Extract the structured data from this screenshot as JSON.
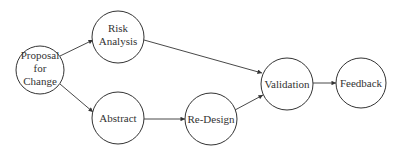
{
  "diagram": {
    "type": "flowchart",
    "nodes": [
      {
        "id": "proposal",
        "lines": [
          "Proposal",
          "for",
          "Change"
        ],
        "cx": 40,
        "cy": 70,
        "r": 24
      },
      {
        "id": "risk",
        "lines": [
          "Risk",
          "Analysis"
        ],
        "cx": 118,
        "cy": 37,
        "r": 26
      },
      {
        "id": "abstract",
        "lines": [
          "Abstract"
        ],
        "cx": 118,
        "cy": 118,
        "r": 26
      },
      {
        "id": "redesign",
        "lines": [
          "Re-Design"
        ],
        "cx": 211,
        "cy": 119,
        "r": 26
      },
      {
        "id": "validation",
        "lines": [
          "Validation"
        ],
        "cx": 287,
        "cy": 84,
        "r": 26
      },
      {
        "id": "feedback",
        "lines": [
          "Feedback"
        ],
        "cx": 361,
        "cy": 83,
        "r": 25
      }
    ],
    "edges": [
      {
        "from": "proposal",
        "to": "risk"
      },
      {
        "from": "proposal",
        "to": "abstract"
      },
      {
        "from": "risk",
        "to": "validation"
      },
      {
        "from": "abstract",
        "to": "redesign"
      },
      {
        "from": "redesign",
        "to": "validation"
      },
      {
        "from": "validation",
        "to": "feedback"
      }
    ]
  },
  "labels": {
    "proposal": {
      "l0": "Proposal",
      "l1": "for",
      "l2": "Change"
    },
    "risk": {
      "l0": "Risk",
      "l1": "Analysis"
    },
    "abstract": {
      "l0": "Abstract"
    },
    "redesign": {
      "l0": "Re-Design"
    },
    "validation": {
      "l0": "Validation"
    },
    "feedback": {
      "l0": "Feedback"
    }
  },
  "colors": {
    "stroke": "#333333",
    "background": "#ffffff"
  }
}
